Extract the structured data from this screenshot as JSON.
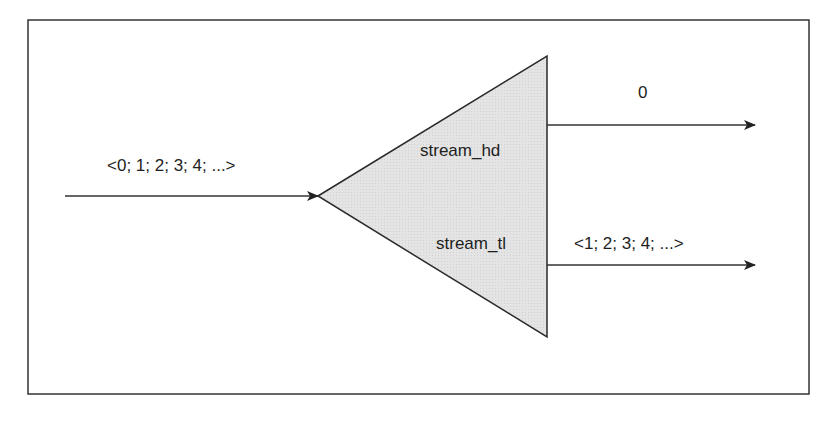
{
  "diagram": {
    "input_label": "<0; 1; 2; 3; 4; ...>",
    "block": {
      "top_port_label": "stream_hd",
      "bottom_port_label": "stream_tl",
      "fill": "#e6e6e6",
      "stroke": "#2a2a2a"
    },
    "outputs": {
      "head_label": "0",
      "tail_label": "<1; 2; 3; 4; ...>"
    }
  }
}
